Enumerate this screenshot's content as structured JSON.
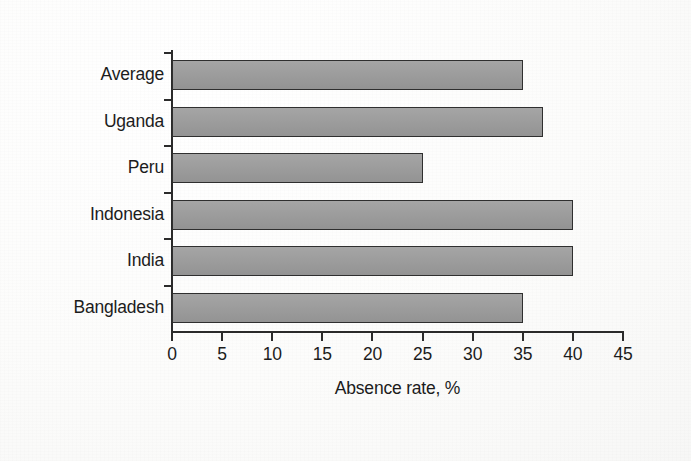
{
  "chart_data": {
    "type": "bar",
    "orientation": "horizontal",
    "title": "",
    "xlabel": "Absence rate, %",
    "ylabel": "",
    "categories": [
      "Bangladesh",
      "India",
      "Indonesia",
      "Peru",
      "Uganda",
      "Average"
    ],
    "values": [
      35,
      40,
      40,
      25,
      37,
      35
    ],
    "series": [
      {
        "name": "Absence rate",
        "values": [
          35,
          40,
          40,
          25,
          37,
          35
        ]
      }
    ],
    "xlim": [
      0,
      45
    ],
    "xticks": [
      0,
      5,
      10,
      15,
      20,
      25,
      30,
      35,
      40,
      45
    ],
    "xtick_labels": [
      "0",
      "5",
      "10",
      "15",
      "20",
      "25",
      "30",
      "35",
      "40",
      "45"
    ],
    "grid": false,
    "legend": false,
    "legend_position": "none",
    "bar_color": "#9b9b9b",
    "bar_edge_color": "#2f2f2f",
    "axis_color": "#2b2b2b",
    "text_color": "#1c1c1c",
    "background_color": "#fbfbfa",
    "category_order_top_to_bottom": [
      "Average",
      "Uganda",
      "Peru",
      "Indonesia",
      "India",
      "Bangladesh"
    ],
    "annotations": []
  },
  "axes": {
    "x_title": "Absence rate, %",
    "x_tick_labels": [
      "0",
      "5",
      "10",
      "15",
      "20",
      "25",
      "30",
      "35",
      "40",
      "45"
    ],
    "y_tick_labels": [
      "Average",
      "Uganda",
      "Peru",
      "Indonesia",
      "India",
      "Bangladesh"
    ]
  },
  "bars": [
    {
      "label": "Average",
      "value": 35
    },
    {
      "label": "Uganda",
      "value": 37
    },
    {
      "label": "Peru",
      "value": 25
    },
    {
      "label": "Indonesia",
      "value": 40
    },
    {
      "label": "India",
      "value": 40
    },
    {
      "label": "Bangladesh",
      "value": 35
    }
  ]
}
